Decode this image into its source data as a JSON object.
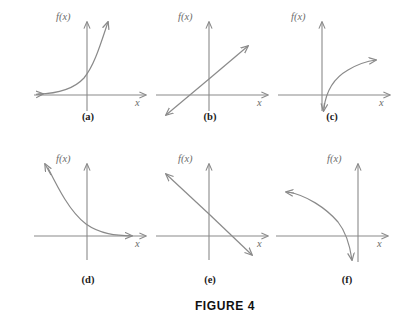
{
  "figure": {
    "title": "FIGURE 4",
    "axis_label_y": "f(x)",
    "axis_label_x": "x",
    "stroke_color": "#8a8a8a",
    "text_color": "#1a1a1a"
  },
  "panels": [
    {
      "caption": "(a)",
      "curve_type": "increasing-exponential",
      "description": "Increasing exponential curve approaching the x-axis on the left and rising steeply on the right",
      "y_label": "f(x)",
      "x_label": "x"
    },
    {
      "caption": "(b)",
      "curve_type": "increasing-line",
      "description": "Straight line with positive slope and positive y-intercept, arrows at both ends",
      "y_label": "f(x)",
      "x_label": "x"
    },
    {
      "caption": "(c)",
      "curve_type": "increasing-logarithm",
      "description": "Logarithmic curve dropping steeply near the y-axis and rising slowly to the right",
      "y_label": "f(x)",
      "x_label": "x"
    },
    {
      "caption": "(d)",
      "curve_type": "decreasing-exponential",
      "description": "Decaying exponential curve high on the left approaching the x-axis on the right",
      "y_label": "f(x)",
      "x_label": "x"
    },
    {
      "caption": "(e)",
      "curve_type": "decreasing-line",
      "description": "Straight line with negative slope and positive y-intercept, arrows at both ends",
      "y_label": "f(x)",
      "x_label": "x"
    },
    {
      "caption": "(f)",
      "curve_type": "decreasing-logarithm",
      "description": "Reflected logarithmic curve descending from upper left and plunging down near the y-axis",
      "y_label": "f(x)",
      "x_label": "x"
    }
  ]
}
